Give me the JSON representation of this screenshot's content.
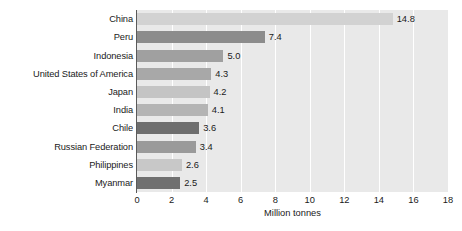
{
  "chart_data": {
    "type": "bar",
    "orientation": "horizontal",
    "title": "",
    "subtitle": "",
    "xlabel": "Million tonnes",
    "ylabel": "",
    "xlim": [
      0,
      18
    ],
    "xticks": [
      0,
      2,
      4,
      6,
      8,
      10,
      12,
      14,
      16,
      18
    ],
    "xtick_labels": [
      "0",
      "2",
      "4",
      "6",
      "8",
      "10",
      "12",
      "14",
      "16",
      "18"
    ],
    "grid": "vertical",
    "legend": "none",
    "categories": [
      "China",
      "Peru",
      "Indonesia",
      "United States of America",
      "Japan",
      "India",
      "Chile",
      "Russian Federation",
      "Philippines",
      "Myanmar"
    ],
    "values": [
      14.8,
      7.4,
      5.0,
      4.3,
      4.2,
      4.1,
      3.6,
      3.4,
      2.6,
      2.5
    ],
    "value_labels": [
      "14.8",
      "7.4",
      "5.0",
      "4.3",
      "4.2",
      "4.1",
      "3.6",
      "3.4",
      "2.6",
      "2.5"
    ],
    "bar_colors": [
      "#d2d2d2",
      "#8c8c8c",
      "#a0a0a0",
      "#a8a8a8",
      "#c4c4c4",
      "#b4b4b4",
      "#6e6e6e",
      "#9a9a9a",
      "#c8c8c8",
      "#707070"
    ],
    "plot_background": "#e9e9e9",
    "gridline_color": "#ffffff",
    "axis_color": "#5a5a5a",
    "text_color": "#1a1a1a"
  }
}
